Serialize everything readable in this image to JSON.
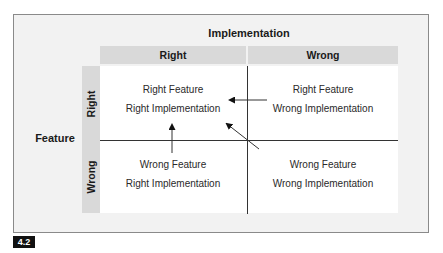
{
  "diagram": {
    "type": "2x2-matrix",
    "x_axis_title": "Implementation",
    "y_axis_title": "Feature",
    "columns": [
      {
        "label": "Right"
      },
      {
        "label": "Wrong"
      }
    ],
    "rows": [
      {
        "label": "Right"
      },
      {
        "label": "Wrong"
      }
    ],
    "cells": {
      "right_right": {
        "line1": "Right Feature",
        "line2": "Right Implementation"
      },
      "right_wrong": {
        "line1": "Right Feature",
        "line2": "Wrong Implementation"
      },
      "wrong_right": {
        "line1": "Wrong Feature",
        "line2": "Right Implementation"
      },
      "wrong_wrong": {
        "line1": "Wrong Feature",
        "line2": "Wrong Implementation"
      }
    },
    "arrows": [
      {
        "from": "Right Feature / Wrong Implementation",
        "to": "Right Feature / Right Implementation",
        "direction": "left"
      },
      {
        "from": "Wrong Feature / Right Implementation",
        "to": "Right Feature / Right Implementation",
        "direction": "up"
      },
      {
        "from": "Wrong Feature / Wrong Implementation",
        "to": "Right Feature / Right Implementation",
        "direction": "diagonal-up-left"
      }
    ],
    "figure_number": "4.2",
    "colors": {
      "frame_background": "#f2f2f2",
      "header_band": "#d9d9d9",
      "grid_background": "#ffffff",
      "lines": "#333333",
      "figure_label_bg": "#111111"
    }
  }
}
